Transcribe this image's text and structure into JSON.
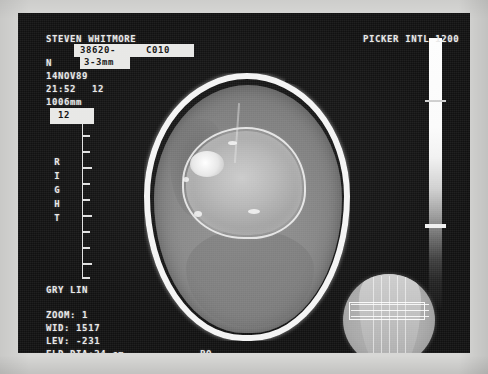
{
  "device": {
    "vendor_label": "PICKER INTL 1200"
  },
  "patient": {
    "name": "STEVEN WHITMORE",
    "study_id": "38620-",
    "series_id": "C010"
  },
  "acquisition": {
    "orientation_letter": "N",
    "slice_thickness": "3-3mm",
    "date": "14NOV89",
    "time": "21:52",
    "image_number": "12",
    "table_position": "1006mm",
    "slice_box_value": "12",
    "position_code": "PO",
    "side_marker": "RIGHT"
  },
  "display": {
    "lut_label": "GRY LIN",
    "zoom": "ZOOM: 1",
    "window_width": "WID: 1517",
    "window_level": "LEV: -231",
    "field_of_view": "FLD DIA:24 cm"
  },
  "colors": {
    "film_background": "#111111",
    "frame_border": "#d8d8d6",
    "overlay_text": "#e9e9e9",
    "inverted_field_bg": "#e8e8e6"
  },
  "image": {
    "main_view_name": "axial-head-ct",
    "localizer_name": "scout-localizer-inset",
    "grayscale_bar_name": "grayscale-reference-bar"
  }
}
